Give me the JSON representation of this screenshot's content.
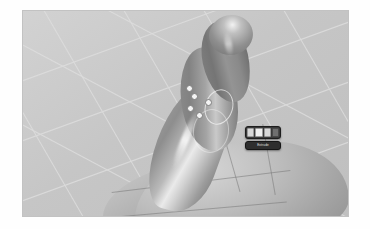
{
  "app": {
    "viewport_name": "3d-viewport",
    "background_color": "#c9c9c9",
    "grid_color": "#dedede",
    "shading_mode": "solid"
  },
  "scene": {
    "objects": [
      {
        "name": "curved-tube",
        "label": "Tube",
        "material_color": "#9a9a9a"
      },
      {
        "name": "body-mesh",
        "label": "Body",
        "material_color": "#bdbdbd"
      }
    ],
    "control_points": [
      {
        "name": "vertex-handle-1",
        "x": 186,
        "y": 86
      },
      {
        "name": "vertex-handle-2",
        "x": 191,
        "y": 94
      },
      {
        "name": "vertex-handle-3",
        "x": 187,
        "y": 105
      },
      {
        "name": "vertex-handle-4",
        "x": 196,
        "y": 112
      },
      {
        "name": "vertex-handle-5",
        "x": 205,
        "y": 99
      }
    ]
  },
  "hud": {
    "name": "floating-toolbar",
    "buttons": [
      {
        "name": "hud-button-1",
        "label": "",
        "state": "normal"
      },
      {
        "name": "hud-button-2",
        "label": "",
        "state": "selected"
      },
      {
        "name": "hud-button-3",
        "label": "",
        "state": "normal"
      },
      {
        "name": "hud-button-4",
        "label": "",
        "state": "dark"
      }
    ],
    "status_label": "Extrude"
  }
}
